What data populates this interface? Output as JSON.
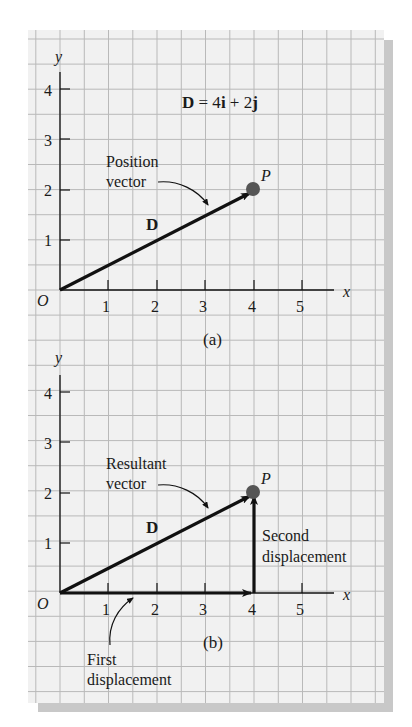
{
  "panels": [
    {
      "id": "a",
      "caption": "(a)",
      "equation": {
        "bold": "D",
        "rest": " = 4",
        "i": "i",
        "plus": " + 2",
        "j": "j"
      },
      "y_axis_label": "y",
      "x_axis_label": "x",
      "origin_label": "O",
      "x_ticks": [
        "1",
        "2",
        "3",
        "4",
        "5"
      ],
      "y_ticks": [
        "1",
        "2",
        "3",
        "4"
      ],
      "point_label": "P",
      "vector_label": "D",
      "annotation_line1": "Position",
      "annotation_line2": "vector"
    },
    {
      "id": "b",
      "caption": "(b)",
      "y_axis_label": "y",
      "x_axis_label": "x",
      "origin_label": "O",
      "x_ticks": [
        "1",
        "2",
        "3",
        "4",
        "5"
      ],
      "y_ticks": [
        "1",
        "2",
        "3",
        "4"
      ],
      "point_label": "P",
      "vector_label": "D",
      "annotation_line1": "Resultant",
      "annotation_line2": "vector",
      "second_line1": "Second",
      "second_line2": "displacement",
      "first_line1": "First",
      "first_line2": "displacement"
    }
  ],
  "colors": {
    "grid": "#b9b9b9",
    "background": "#f1f1f1",
    "ink": "#111111",
    "shadow": "#c8c8c8",
    "point": "#555555"
  }
}
